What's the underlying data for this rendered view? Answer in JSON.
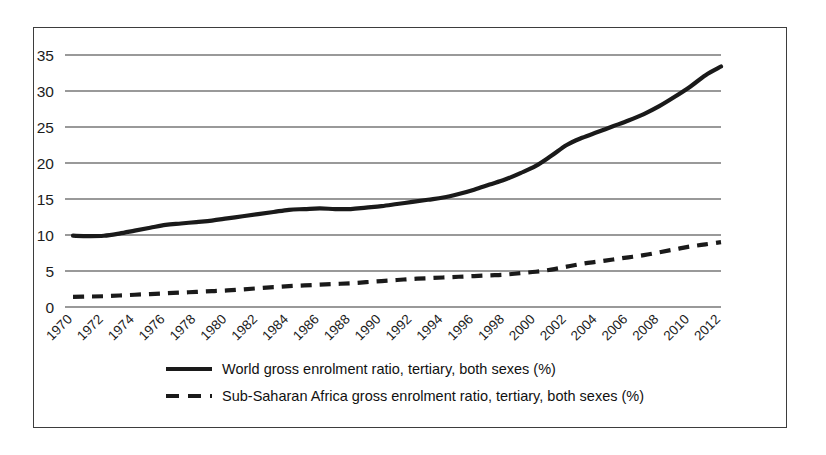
{
  "chart_data": {
    "type": "line",
    "title": "",
    "xlabel": "",
    "ylabel": "",
    "ylim": [
      0,
      35
    ],
    "yticks": [
      0,
      5,
      10,
      15,
      20,
      25,
      30,
      35
    ],
    "grid": true,
    "legend_position": "bottom",
    "categories": [
      "1970",
      "1971",
      "1972",
      "1973",
      "1974",
      "1975",
      "1976",
      "1977",
      "1978",
      "1979",
      "1980",
      "1981",
      "1982",
      "1983",
      "1984",
      "1985",
      "1986",
      "1987",
      "1988",
      "1989",
      "1990",
      "1991",
      "1992",
      "1993",
      "1994",
      "1995",
      "1996",
      "1997",
      "1998",
      "1999",
      "2000",
      "2001",
      "2002",
      "2003",
      "2004",
      "2005",
      "2006",
      "2007",
      "2008",
      "2009",
      "2010",
      "2011",
      "2012"
    ],
    "xtick_labels": [
      "1970",
      "1972",
      "1974",
      "1976",
      "1978",
      "1980",
      "1982",
      "1984",
      "1986",
      "1988",
      "1990",
      "1992",
      "1994",
      "1996",
      "1998",
      "2000",
      "2002",
      "2004",
      "2006",
      "2008",
      "2010",
      "2012"
    ],
    "series": [
      {
        "name": "World gross enrolment ratio, tertiary, both sexes (%)",
        "style": "solid",
        "color": "#1a1a1a",
        "values": [
          9.9,
          9.85,
          9.9,
          10.2,
          10.6,
          11.0,
          11.4,
          11.6,
          11.8,
          12.0,
          12.3,
          12.6,
          12.9,
          13.2,
          13.5,
          13.6,
          13.7,
          13.6,
          13.6,
          13.8,
          14.0,
          14.3,
          14.6,
          14.9,
          15.2,
          15.7,
          16.3,
          17.0,
          17.7,
          18.6,
          19.6,
          21.0,
          22.5,
          23.5,
          24.3,
          25.1,
          25.9,
          26.8,
          27.9,
          29.2,
          30.6,
          32.2,
          33.4
        ]
      },
      {
        "name": "Sub-Saharan Africa gross enrolment ratio, tertiary, both sexes (%)",
        "style": "dashed",
        "color": "#1a1a1a",
        "values": [
          1.4,
          1.45,
          1.5,
          1.6,
          1.7,
          1.8,
          1.9,
          2.0,
          2.1,
          2.2,
          2.3,
          2.45,
          2.6,
          2.75,
          2.9,
          3.0,
          3.1,
          3.2,
          3.3,
          3.45,
          3.6,
          3.75,
          3.9,
          4.0,
          4.1,
          4.2,
          4.3,
          4.4,
          4.5,
          4.7,
          4.9,
          5.2,
          5.6,
          6.0,
          6.3,
          6.6,
          6.9,
          7.2,
          7.6,
          8.0,
          8.4,
          8.7,
          9.0
        ]
      }
    ]
  },
  "legend": {
    "items": [
      {
        "label": "World gross enrolment ratio, tertiary, both sexes (%)",
        "style": "solid"
      },
      {
        "label": "Sub-Saharan Africa gross enrolment ratio, tertiary, both sexes (%)",
        "style": "dashed"
      }
    ]
  }
}
